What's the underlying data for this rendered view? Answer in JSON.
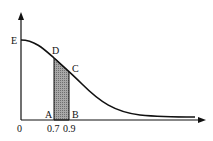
{
  "diagram": {
    "type": "decreasing bell-shaped curve with shaded strip",
    "points": {
      "E": "E",
      "D": "D",
      "C": "C",
      "A": "A",
      "B": "B"
    },
    "x_ticks": [
      "0",
      "0.7",
      "0.9"
    ],
    "shaded_region": {
      "from": "0.7",
      "to": "0.9",
      "fill": "#9a9a9a"
    },
    "colors": {
      "line": "#111111",
      "background": "#ffffff"
    }
  }
}
